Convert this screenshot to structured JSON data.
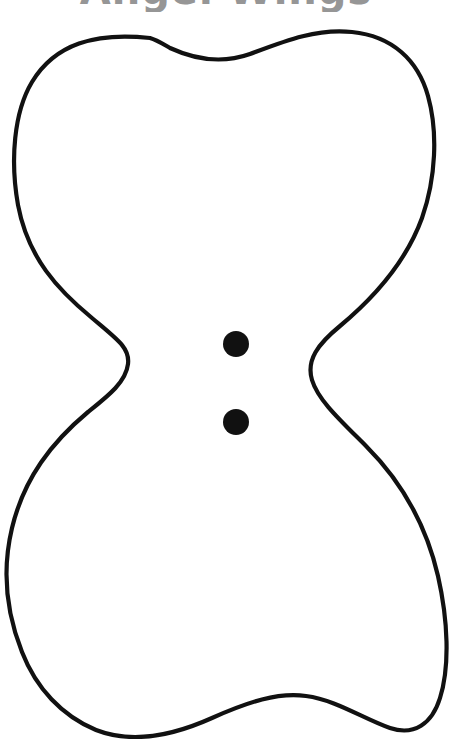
{
  "page": {
    "title": "Angel Wings",
    "background_color": "#ffffff",
    "width": 452,
    "height": 739
  },
  "heading": {
    "text": "Angel Wings",
    "color": "#969696",
    "clipped": "true",
    "align": "center"
  },
  "template": {
    "name": "angel-wings-outline",
    "outline_color": "#111111",
    "fill_color": "#ffffff",
    "stroke_width": "4.2",
    "description": "Hourglass / bow-tie shaped angel wings cut-out outline"
  },
  "markers": {
    "label": "attachment dots",
    "color": "#111111",
    "dots": [
      {
        "name": "upper-dot",
        "cx": 236,
        "cy": 344,
        "r": 13
      },
      {
        "name": "lower-dot",
        "cx": 236,
        "cy": 422,
        "r": 13
      }
    ]
  }
}
